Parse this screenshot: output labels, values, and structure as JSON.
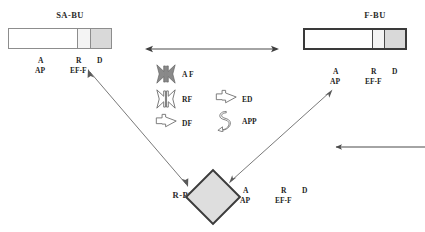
{
  "diagram": {
    "title_hidden": "",
    "background": "#ffffff",
    "line_color": "#5a5a5a",
    "icon_fill_dark": "#8a8a8a",
    "icon_fill_light": "#ffffff",
    "icon_stroke": "#6e6e6e"
  },
  "nodes": [
    {
      "id": "sa-bu",
      "title": "SA-BU",
      "shape": "bar",
      "border": "thin",
      "segments": [
        {
          "name": "A",
          "fill": "#ffffff",
          "width_pct": 67
        },
        {
          "name": "R",
          "fill": "#f4f4f4",
          "width_pct": 12
        },
        {
          "name": "D",
          "fill": "#d9d9d9",
          "width_pct": 21
        }
      ],
      "annotations": [
        {
          "top": "A",
          "bottom": "AP"
        },
        {
          "top": "R",
          "bottom": "EF-F"
        },
        {
          "top": "D",
          "bottom": ""
        }
      ]
    },
    {
      "id": "f-bu",
      "title": "F-BU",
      "shape": "bar",
      "border": "thick",
      "segments": [
        {
          "name": "A",
          "fill": "#ffffff",
          "width_pct": 67
        },
        {
          "name": "R",
          "fill": "#f4f4f4",
          "width_pct": 12
        },
        {
          "name": "D",
          "fill": "#d9d9d9",
          "width_pct": 21
        }
      ],
      "annotations": [
        {
          "top": "A",
          "bottom": "AP"
        },
        {
          "top": "R",
          "bottom": "EF-F"
        },
        {
          "top": "D",
          "bottom": ""
        }
      ]
    },
    {
      "id": "r-bu",
      "title": "R-BU",
      "shape": "diamond",
      "fill": "#dedede",
      "annotations": [
        {
          "top": "A",
          "bottom": "AP"
        },
        {
          "top": "R",
          "bottom": "EF-F"
        },
        {
          "top": "D",
          "bottom": ""
        }
      ]
    }
  ],
  "legend": {
    "items": [
      {
        "label": "A F",
        "icon": "double-inward-arrow-filled-icon",
        "style": "filled"
      },
      {
        "label": "RF",
        "icon": "double-inward-arrow-outline-icon",
        "style": "outline"
      },
      {
        "label": "DF",
        "icon": "right-arrow-outline-icon",
        "style": "outline"
      },
      {
        "label": "ED",
        "icon": "right-arrow-outline-icon",
        "style": "outline"
      },
      {
        "label": "APP",
        "icon": "curved-recycle-arrow-icon",
        "style": "outline"
      }
    ]
  },
  "connectors": [
    {
      "name": "sa-bu-to-f-bu",
      "type": "double-headed",
      "orientation": "horizontal"
    },
    {
      "name": "sa-bu-to-r-bu",
      "type": "double-headed",
      "orientation": "diagonal-down-right"
    },
    {
      "name": "r-bu-to-f-bu",
      "type": "double-headed",
      "orientation": "diagonal-up-right"
    }
  ]
}
